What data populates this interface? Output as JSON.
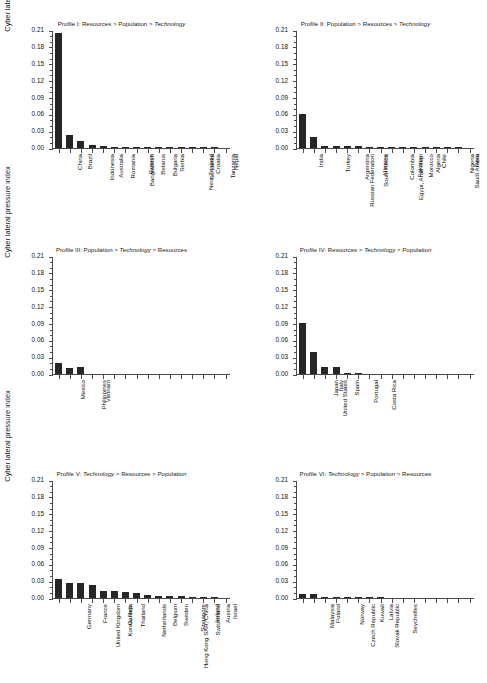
{
  "figure": {
    "ylabel": "Cyber lateral pressure index",
    "y_ticks": [
      "0.00",
      "0.03",
      "0.06",
      "0.09",
      "0.12",
      "0.15",
      "0.18",
      "0.21"
    ],
    "bar_color": "#262626",
    "axis_color": "#4a4a4a"
  },
  "chart_data": [
    {
      "type": "bar",
      "title": "Profile I: Resources > Population > Technology",
      "title_parts": [
        {
          "text": "Profile I: Resources > Population > ",
          "italic": false
        },
        {
          "text": "Technology",
          "italic": true
        }
      ],
      "ylabel": "Cyber lateral pressure index",
      "xlabel": "",
      "ylim": [
        0,
        0.21
      ],
      "ytick_step": 0.03,
      "grid": false,
      "n_tick_slots": 16,
      "categories": [
        "China",
        "Brazil",
        "Indonesia",
        "Australia",
        "Romania",
        "Bangladesh",
        "Greece",
        "Belarus",
        "Bulgaria",
        "Serbia",
        "New Zealand",
        "Sri Lanka",
        "Croatia",
        "Tanzania",
        "Nepal"
      ],
      "values": [
        0.205,
        0.023,
        0.012,
        0.005,
        0.003,
        0.002,
        0.001,
        0.001,
        0.0008,
        0.0006,
        0.0005,
        0.0004,
        0.0003,
        0.0002,
        0.0002
      ]
    },
    {
      "type": "bar",
      "title": "Profile II: Population > Resources > Technology",
      "title_parts": [
        {
          "text": "Profile II: Population > Resources > ",
          "italic": false
        },
        {
          "text": "Technology",
          "italic": true
        }
      ],
      "ylabel": "Cyber lateral pressure index",
      "xlabel": "",
      "ylim": [
        0,
        0.21
      ],
      "ytick_step": 0.03,
      "grid": false,
      "n_tick_slots": 16,
      "categories": [
        "India",
        "Russian Federation",
        "Turkey",
        "Argentina",
        "South Africa",
        "Ukraine",
        "Egypt, Arab Rep.",
        "Colombia",
        "Pakistan",
        "Morocco",
        "Algeria",
        "Chile",
        "Saudi Arabia",
        "Nigeria",
        "Peru"
      ],
      "values": [
        0.06,
        0.02,
        0.004,
        0.004,
        0.003,
        0.003,
        0.002,
        0.002,
        0.002,
        0.0015,
        0.001,
        0.001,
        0.0008,
        0.0005,
        0.0004
      ]
    },
    {
      "type": "bar",
      "title": "Profile III: Population > Technology > Resources",
      "title_parts": [
        {
          "text": "Profile III: Population > ",
          "italic": false
        },
        {
          "text": "Technology",
          "italic": true
        },
        {
          "text": " > Resources",
          "italic": false
        }
      ],
      "ylabel": "Cyber lateral pressure index",
      "xlabel": "",
      "ylim": [
        0,
        0.21
      ],
      "ytick_step": 0.03,
      "grid": false,
      "n_tick_slots": 16,
      "categories": [
        "Mexico",
        "Philippines",
        "Vietnam"
      ],
      "values": [
        0.02,
        0.011,
        0.012
      ]
    },
    {
      "type": "bar",
      "title": "Profile IV: Resources > Technology > Population",
      "title_parts": [
        {
          "text": "Profile IV: Resources > ",
          "italic": false
        },
        {
          "text": "Technology",
          "italic": true
        },
        {
          "text": " > Population",
          "italic": false
        }
      ],
      "ylabel": "Cyber lateral pressure index",
      "xlabel": "",
      "ylim": [
        0,
        0.21
      ],
      "ytick_step": 0.03,
      "grid": false,
      "n_tick_slots": 16,
      "categories": [
        "United States",
        "Japan",
        "Italy",
        "Spain",
        "Portugal",
        "Costa Rica"
      ],
      "values": [
        0.09,
        0.04,
        0.013,
        0.012,
        0.002,
        0.0005
      ]
    },
    {
      "type": "bar",
      "title": "Profile V: Technology > Resources > Population",
      "title_parts": [
        {
          "text": "Profile V: ",
          "italic": false
        },
        {
          "text": "Technology",
          "italic": true
        },
        {
          "text": " > Resources > Population",
          "italic": false
        }
      ],
      "ylabel": "Cyber lateral pressure index",
      "xlabel": "",
      "ylim": [
        0,
        0.21
      ],
      "ytick_step": 0.03,
      "grid": false,
      "n_tick_slots": 16,
      "categories": [
        "Germany",
        "United Kingdom",
        "France",
        "Korea, Rep.",
        "Canada",
        "Thailand",
        "Netherlands",
        "Hong Kong SAR, China",
        "Belgium",
        "Sweden",
        "Singapore",
        "Switzerland",
        "Ireland",
        "Austria",
        "Israel"
      ],
      "values": [
        0.033,
        0.026,
        0.026,
        0.023,
        0.012,
        0.012,
        0.01,
        0.009,
        0.006,
        0.004,
        0.004,
        0.003,
        0.002,
        0.002,
        0.002
      ]
    },
    {
      "type": "bar",
      "title": "Profile VI: Technology > Population > Resources",
      "title_parts": [
        {
          "text": "Profile VI: ",
          "italic": false
        },
        {
          "text": "Technology",
          "italic": true
        },
        {
          "text": " > Population > Resources",
          "italic": false
        }
      ],
      "ylabel": "Cyber lateral pressure index",
      "xlabel": "",
      "ylim": [
        0,
        0.21
      ],
      "ytick_step": 0.03,
      "grid": false,
      "n_tick_slots": 16,
      "categories": [
        "Malaysia",
        "Poland",
        "Czech Republic",
        "Norway",
        "Slovak Republic",
        "Kuwait",
        "Latvia",
        "Seychelles"
      ],
      "values": [
        0.007,
        0.007,
        0.002,
        0.001,
        0.001,
        0.0003,
        0.0002,
        0.0002
      ]
    }
  ]
}
